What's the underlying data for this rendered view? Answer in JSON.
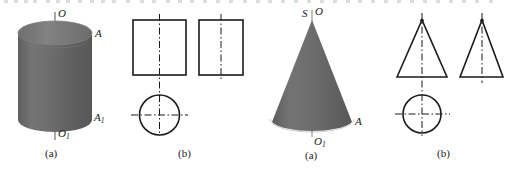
{
  "figure": {
    "background_color": "#ffffff",
    "ink_color": "#1b1b1b",
    "solid_fill_color": "#6e6e6e",
    "solid_top_face_color": "#7d7d7d",
    "panels": [
      {
        "id": "cylinder-pictorial",
        "shape": "cylinder",
        "caption": "(a)",
        "labels": [
          {
            "name": "axis-top",
            "text": "O"
          },
          {
            "name": "top-right-edge",
            "text": "A"
          },
          {
            "name": "bottom-right-edge",
            "text": "A",
            "sub": "1"
          },
          {
            "name": "axis-bottom",
            "text": "O",
            "sub": "1"
          }
        ]
      },
      {
        "id": "cylinder-projections",
        "shape": "orthographic-views",
        "caption": "(b)",
        "views": [
          "rectangle-front",
          "rectangle-side",
          "circle-top"
        ]
      },
      {
        "id": "cone-pictorial",
        "shape": "cone",
        "caption": "(a)",
        "labels": [
          {
            "name": "apex-left",
            "text": "S"
          },
          {
            "name": "apex-right",
            "text": "O"
          },
          {
            "name": "base-right-edge",
            "text": "A"
          },
          {
            "name": "base-center",
            "text": "O",
            "sub": "1"
          }
        ]
      },
      {
        "id": "cone-projections",
        "shape": "orthographic-views",
        "caption": "(b)",
        "views": [
          "triangle-front",
          "triangle-side",
          "circle-top"
        ]
      }
    ],
    "captions": {
      "cylinder_pictorial": "(a)",
      "cylinder_projection": "(b)",
      "cone_pictorial": "(a)",
      "cone_projection": "(b)"
    },
    "cylinder_labels": {
      "axis_top": "O",
      "edge_top": "A",
      "edge_bottom_base": "A",
      "edge_bottom_sub": "1",
      "axis_bottom_base": "O",
      "axis_bottom_sub": "1"
    },
    "cone_labels": {
      "apex_s": "S",
      "apex_o": "O",
      "base_edge": "A",
      "base_center_base": "O",
      "base_center_sub": "1"
    }
  }
}
